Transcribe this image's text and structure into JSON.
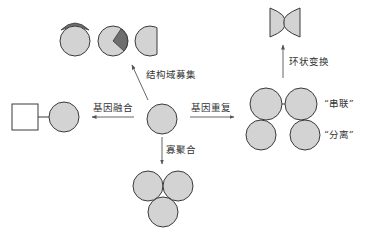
{
  "diagram": {
    "colors": {
      "domain_fill": "#d3d3d3",
      "domain_stroke": "#3a3a3a",
      "highlight_fill": "#6e6e6e",
      "arrow": "#555555"
    },
    "center_node": {
      "label": "",
      "shape": "circle"
    },
    "transitions": [
      {
        "id": "domain-recruitment",
        "label": "结构域募集",
        "direction": "up-left"
      },
      {
        "id": "gene-fusion",
        "label": "基因融合",
        "direction": "left"
      },
      {
        "id": "gene-duplication",
        "label": "基因重复",
        "direction": "right"
      },
      {
        "id": "oligomerization",
        "label": "寡聚合",
        "direction": "down"
      },
      {
        "id": "circular-permutation",
        "label": "环状变换",
        "direction": "up"
      }
    ],
    "arrangements": {
      "tandem": "“串联”",
      "separate": "“分离”"
    }
  }
}
